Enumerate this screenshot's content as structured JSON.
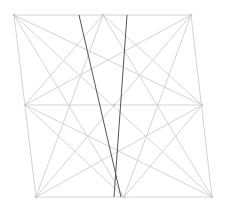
{
  "diagram": {
    "width": 226,
    "height": 210,
    "background": "#ffffff",
    "colors": {
      "light_line": "#d4d4d4",
      "dark_line": "#555555",
      "node": "#c8c8c8"
    },
    "points": {
      "TL": [
        14,
        15
      ],
      "TM": [
        103,
        15
      ],
      "TR": [
        191,
        15
      ],
      "ML": [
        25,
        105
      ],
      "MM": [
        114,
        105
      ],
      "MR": [
        202,
        105
      ],
      "BL": [
        36,
        197
      ],
      "BM": [
        124,
        197
      ],
      "BR": [
        212,
        197
      ]
    },
    "light_lines": [
      [
        "TL",
        "TR"
      ],
      [
        "BL",
        "BR"
      ],
      [
        "TL",
        "BL"
      ],
      [
        "TR",
        "BR"
      ],
      [
        "ML",
        "MR"
      ],
      [
        "TL",
        "BR"
      ],
      [
        "TR",
        "BL"
      ],
      [
        "TL",
        "BM"
      ],
      [
        "TL",
        "MR"
      ],
      [
        "TR",
        "BM"
      ],
      [
        "TR",
        "ML"
      ],
      [
        "BL",
        "TM"
      ],
      [
        "BL",
        "MR"
      ],
      [
        "BR",
        "TM"
      ],
      [
        "BR",
        "ML"
      ],
      [
        "TM",
        "ML"
      ],
      [
        "TM",
        "MR"
      ],
      [
        "BM",
        "ML"
      ],
      [
        "BM",
        "MR"
      ]
    ],
    "dark_lines": [
      [
        [
          79,
          15
        ],
        [
          121,
          197
        ]
      ],
      [
        [
          127,
          15
        ],
        [
          114,
          197
        ]
      ]
    ],
    "nodes": [
      "TL",
      "TR",
      "BL",
      "BR",
      "TM",
      "BM",
      "ML",
      "MR",
      "MM"
    ]
  }
}
